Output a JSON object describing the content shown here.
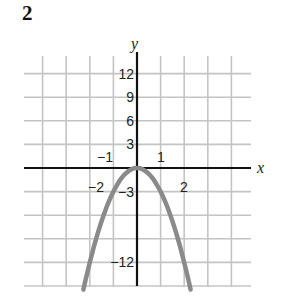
{
  "problem_number": "2",
  "chart_data": {
    "type": "line",
    "title": "",
    "xlabel": "x",
    "ylabel": "y",
    "function": "y = -3x^2",
    "xlim": [
      -4.75,
      4.75
    ],
    "ylim": [
      -15,
      15
    ],
    "grid": true,
    "grid_x_step": 1,
    "grid_y_step": 3,
    "x_tick_labels": [
      {
        "value": -2,
        "label": "-2"
      },
      {
        "value": -1,
        "label": "-1"
      },
      {
        "value": 1,
        "label": "1"
      },
      {
        "value": 2,
        "label": "2"
      }
    ],
    "y_tick_labels": [
      {
        "value": 12,
        "label": "12"
      },
      {
        "value": 9,
        "label": "9"
      },
      {
        "value": 6,
        "label": "6"
      },
      {
        "value": 3,
        "label": "3"
      },
      {
        "value": -3,
        "label": "-3"
      },
      {
        "value": -12,
        "label": "-12"
      }
    ],
    "series": [
      {
        "name": "parabola",
        "x": [
          -2.25,
          -2,
          -1.5,
          -1,
          -0.5,
          0,
          0.5,
          1,
          1.5,
          2,
          2.25
        ],
        "y": [
          -15.19,
          -12,
          -6.75,
          -3,
          -0.75,
          0,
          -0.75,
          -3,
          -6.75,
          -12,
          -15.19
        ],
        "color": "#8a8a8a"
      }
    ],
    "colors": {
      "grid": "#c4c4c4",
      "axis": "#111111",
      "curve": "#8a8a8a"
    }
  }
}
